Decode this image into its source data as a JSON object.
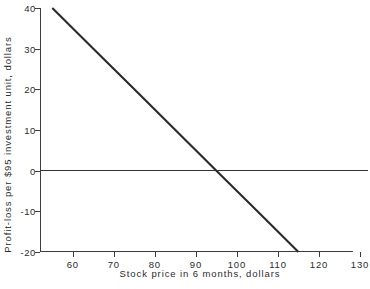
{
  "chart_data": {
    "type": "line",
    "title": "",
    "xlabel": "Stock price in 6 months, dollars",
    "ylabel": "Profit-loss per $95 investment unit, dollars",
    "xlim": [
      52,
      130
    ],
    "ylim": [
      -20,
      40
    ],
    "xticks": [
      60,
      70,
      80,
      90,
      100,
      110,
      120,
      130
    ],
    "xtick_labels": [
      "60",
      "70",
      "80",
      "90",
      "100",
      "110",
      "120",
      "130"
    ],
    "yticks": [
      40,
      30,
      20,
      10,
      0,
      -10,
      -20
    ],
    "ytick_labels": [
      "40",
      "30",
      "20",
      "10",
      "0",
      "-10",
      "-20"
    ],
    "grid": false,
    "legend": "none",
    "series": [
      {
        "name": "Profit-loss",
        "color": "#2a2a2a",
        "x": [
          55,
          65,
          75,
          85,
          95,
          105,
          115
        ],
        "values": [
          40,
          30,
          20,
          10,
          0,
          -10,
          -20
        ]
      }
    ],
    "reference_lines": [
      {
        "name": "break-even",
        "orientation": "horizontal",
        "value": 0,
        "color": "#343434"
      }
    ],
    "annotations": {
      "break_even_x": 95,
      "slope": -1
    }
  },
  "figure": {
    "background": "#ffffff",
    "axis_color": "#3d3d3d",
    "text_color": "#2b2b2b"
  }
}
